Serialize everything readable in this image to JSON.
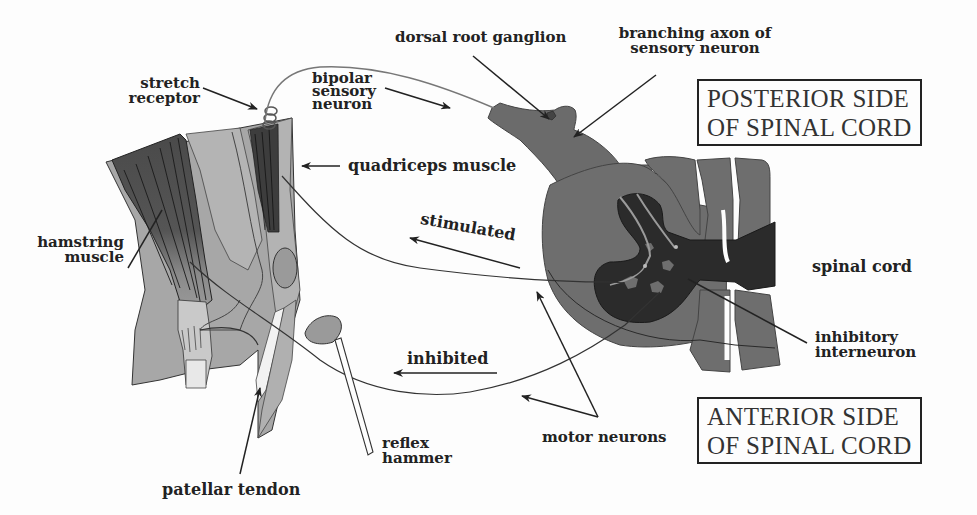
{
  "diagram": {
    "labels": {
      "dorsal_root_ganglion": "dorsal root ganglion",
      "branching_axon_line1": "branching axon of",
      "branching_axon_line2": "sensory neuron",
      "stretch_receptor_line1": "stretch",
      "stretch_receptor_line2": "receptor",
      "bipolar_line1": "bipolar",
      "bipolar_line2": "sensory",
      "bipolar_line3": "neuron",
      "quadriceps": "quadriceps muscle",
      "hamstring_line1": "hamstring",
      "hamstring_line2": "muscle",
      "stimulated": "stimulated",
      "inhibited": "inhibited",
      "spinal_cord": "spinal cord",
      "inhibitory_line1": "inhibitory",
      "inhibitory_line2": "interneuron",
      "motor_neurons": "motor neurons",
      "reflex_hammer_line1": "reflex",
      "reflex_hammer_line2": "hammer",
      "patellar_tendon": "patellar tendon"
    },
    "boxes": {
      "posterior_line1": "POSTERIOR SIDE",
      "posterior_line2": "OF SPINAL CORD",
      "anterior_line1": "ANTERIOR SIDE",
      "anterior_line2": "OF SPINAL CORD"
    },
    "colors": {
      "background": "#fdfdfd",
      "white_matter": "#6e6e6e",
      "gray_matter": "#2b2b2b",
      "muscle_dark": "#4a4a4a",
      "tissue_light": "#a9a9a9",
      "tissue_mid": "#8d8d8d",
      "text": "#222222"
    }
  }
}
